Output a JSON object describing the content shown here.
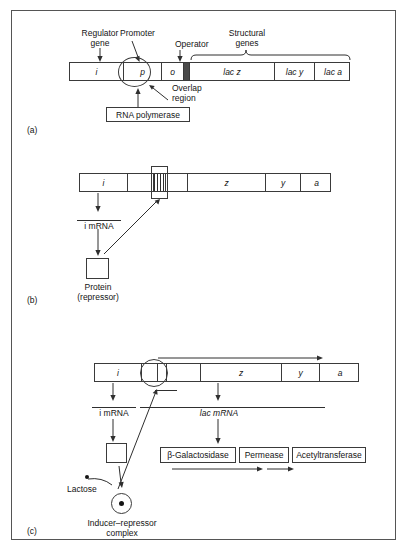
{
  "figure": {
    "panels": [
      {
        "id": "a",
        "label": "(a)"
      },
      {
        "id": "b",
        "label": "(b)"
      },
      {
        "id": "c",
        "label": "(c)"
      }
    ]
  },
  "panel_a": {
    "annotations": {
      "regulator_gene_l1": "Regulator",
      "regulator_gene_l2": "gene",
      "promoter": "Promoter",
      "operator": "Operator",
      "structural_l1": "Structural",
      "structural_l2": "genes",
      "overlap_l1": "Overlap",
      "overlap_l2": "region",
      "rna_polymerase": "RNA polymerase"
    },
    "segments": [
      {
        "name": "i",
        "label": "i"
      },
      {
        "name": "p",
        "label": "p"
      },
      {
        "name": "o",
        "label": "o"
      },
      {
        "name": "lac-z",
        "label": "lac z"
      },
      {
        "name": "lac-y",
        "label": "lac y"
      },
      {
        "name": "lac-a",
        "label": "lac a"
      }
    ]
  },
  "panel_b": {
    "segments": [
      {
        "name": "i",
        "label": "i"
      },
      {
        "name": "p",
        "label": ""
      },
      {
        "name": "o",
        "label": ""
      },
      {
        "name": "z",
        "label": "z"
      },
      {
        "name": "y",
        "label": "y"
      },
      {
        "name": "a",
        "label": "a"
      }
    ],
    "annotations": {
      "i_mrna": "i mRNA",
      "protein_l1": "Protein",
      "protein_l2": "(repressor)"
    }
  },
  "panel_c": {
    "segments": [
      {
        "name": "i",
        "label": "i"
      },
      {
        "name": "p",
        "label": ""
      },
      {
        "name": "o",
        "label": ""
      },
      {
        "name": "z",
        "label": "z"
      },
      {
        "name": "y",
        "label": "y"
      },
      {
        "name": "a",
        "label": "a"
      }
    ],
    "annotations": {
      "i_mrna": "i mRNA",
      "lac_mrna": "lac mRNA",
      "lactose": "Lactose",
      "complex_l1": "Inducer–repressor",
      "complex_l2": "complex"
    },
    "enzymes": [
      {
        "name": "beta-galactosidase",
        "label": "β-Galactosidase"
      },
      {
        "name": "permease",
        "label": "Permease"
      },
      {
        "name": "acetyltransferase",
        "label": "Acetyltransferase"
      }
    ]
  },
  "colors": {
    "ink": "#141414",
    "line": "#2f2f2f",
    "frame": "#555555"
  }
}
